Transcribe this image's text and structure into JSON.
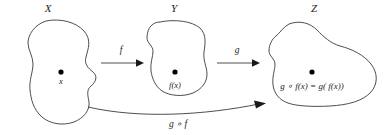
{
  "figure": {
    "title_visible": false,
    "background_color": "#ffffff",
    "stroke_color": "#3a3a3a",
    "text_color": "#1d1d1d",
    "dot_color": "#000000"
  },
  "sets": [
    {
      "id": "X",
      "label": "X",
      "label_x": 48,
      "label_y": 12,
      "point": {
        "dot_x": 61,
        "dot_y": 72,
        "label": "x",
        "label_x": 61,
        "label_y": 84
      }
    },
    {
      "id": "Y",
      "label": "Y",
      "label_x": 174,
      "label_y": 12,
      "point": {
        "dot_x": 175,
        "dot_y": 72,
        "label": "f(x)",
        "label_x": 175,
        "label_y": 88
      }
    },
    {
      "id": "Z",
      "label": "Z",
      "label_x": 314,
      "label_y": 12,
      "point": {
        "dot_x": 312,
        "dot_y": 72,
        "label": "g ∘ f(x) = g( f(x))",
        "label_x": 312,
        "label_y": 89
      }
    }
  ],
  "maps": [
    {
      "id": "f",
      "label": "f",
      "label_x": 121,
      "label_y": 53,
      "from": "X",
      "to": "Y"
    },
    {
      "id": "g",
      "label": "g",
      "label_x": 237,
      "label_y": 53,
      "from": "Y",
      "to": "Z"
    },
    {
      "id": "gof",
      "label": "g ∘ f",
      "label_x": 178,
      "label_y": 127,
      "from": "X",
      "to": "Z"
    }
  ]
}
